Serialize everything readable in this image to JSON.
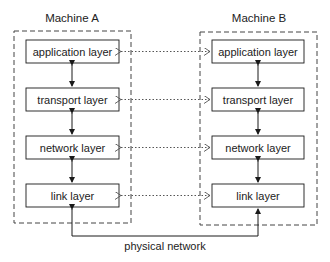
{
  "diagram": {
    "machines": [
      {
        "name": "Machine A",
        "layers": [
          "application layer",
          "transport layer",
          "network layer",
          "link layer"
        ]
      },
      {
        "name": "Machine B",
        "layers": [
          "application layer",
          "transport layer",
          "network layer",
          "link layer"
        ]
      }
    ],
    "connection_label": "physical network",
    "colors": {
      "line": "#1a1a1a",
      "dashed": "#444444",
      "dotted": "#555555",
      "box_fill": "#ffffff"
    }
  }
}
